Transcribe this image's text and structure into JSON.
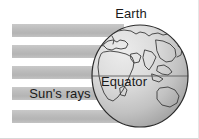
{
  "figure": {
    "background_color": "#ffffff"
  },
  "labels": {
    "earth": "Earth",
    "equator": "Equator",
    "sun_rays": "Sun's rays"
  },
  "colors": {
    "ray_bar": "#b9b9b9",
    "ray_bar_highlight": "#cfcfcf",
    "globe_light": "#e8e8e8",
    "globe_mid": "#c6c6c6",
    "globe_dark": "#9a9a9a",
    "outline": "#2b2b2b",
    "coastline": "#3a3a3a",
    "text": "#1a1a1a",
    "equator": "#5c5c5c"
  },
  "sun_rays": {
    "count": 5,
    "bars": [
      {
        "label": "ray-1",
        "x": 12,
        "y": 24,
        "width": 112,
        "height": 13
      },
      {
        "label": "ray-2",
        "x": 12,
        "y": 45,
        "width": 112,
        "height": 13
      },
      {
        "label": "ray-3",
        "x": 12,
        "y": 66,
        "width": 112,
        "height": 13
      },
      {
        "label": "ray-4",
        "x": 12,
        "y": 87,
        "width": 112,
        "height": 13
      },
      {
        "label": "ray-5",
        "x": 12,
        "y": 110,
        "width": 112,
        "height": 13
      }
    ]
  },
  "globe": {
    "center_x": 140,
    "center_y": 76,
    "radius_x": 48,
    "radius_y": 51,
    "equator_y": 76
  }
}
